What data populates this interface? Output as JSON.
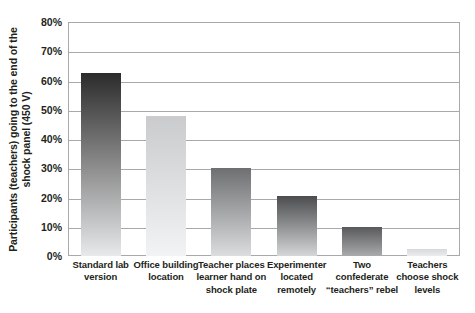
{
  "chart_data": {
    "type": "bar",
    "title": "",
    "subtitle": "",
    "xlabel": "",
    "ylabel": "Participants (teachers) going to the end of the\nshock panel (450 V)",
    "categories": [
      "Standard lab\nversion",
      "Office building\nlocation",
      "Teacher places\nlearner hand on\nshock plate",
      "Experimenter\nlocated\nremotely",
      "Two\nconfederate\n“teachers” rebel",
      "Teachers\nchoose shock\nlevels"
    ],
    "values": [
      62.5,
      48,
      30,
      20.5,
      10,
      2.5
    ],
    "value_labels": [
      "62.5%",
      "48%",
      "30%",
      "20.5%",
      "10%",
      "2.5%"
    ],
    "ylim": [
      0,
      80
    ],
    "ytick_values": [
      0,
      10,
      20,
      30,
      40,
      50,
      60,
      70,
      80
    ],
    "ytick_labels": [
      "0%",
      "10%",
      "20%",
      "30%",
      "40%",
      "50%",
      "60%",
      "70%",
      "80%"
    ],
    "grid": true,
    "legend": false,
    "legend_position": "none",
    "bar_colors_top": [
      "#2b2b2b",
      "#c9cbcd",
      "#6d6f71",
      "#4a4c4e",
      "#58595b",
      "#d6d8da"
    ],
    "bar_colors_bottom": [
      "#e8e9ea",
      "#f2f3f4",
      "#dcdddf",
      "#d4d6d8",
      "#a9abad",
      "#eceded"
    ],
    "frame_color": "#a7a9ac",
    "grid_color": "#a7a9ac",
    "text_color": "#231f20"
  }
}
